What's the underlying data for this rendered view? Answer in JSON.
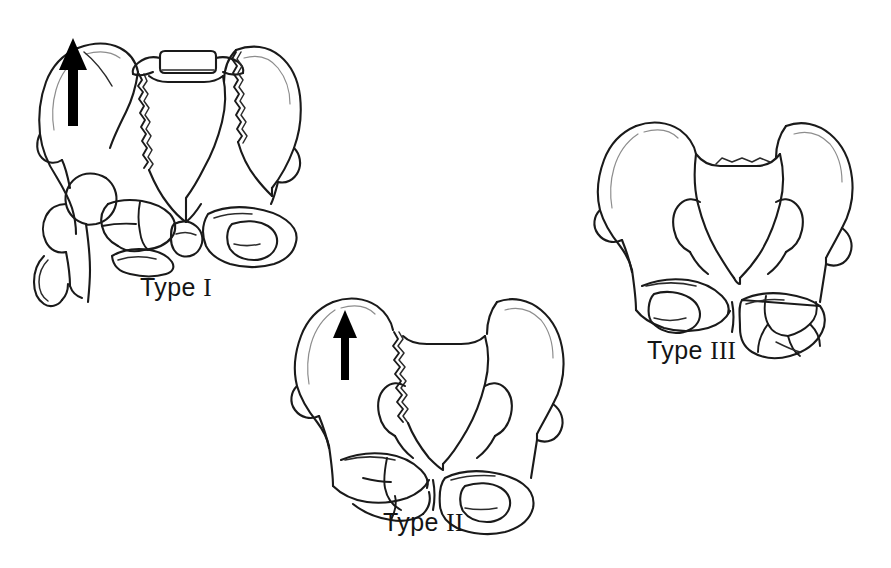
{
  "figure": {
    "kind": "medical-line-illustration",
    "background_color": "#ffffff",
    "ink_color": "#1a1a1a",
    "width": 891,
    "height": 568
  },
  "panels": [
    {
      "id": "type-1",
      "word": "Type",
      "numeral": "I",
      "label": "Type I",
      "label_x": 140,
      "label_y": 262,
      "art_x": 8,
      "art_y": 18,
      "art_w": 330,
      "art_h": 290,
      "has_arrow": true,
      "arrow_direction": "up",
      "arrow_meaning": "vertical displacement of hemipelvis",
      "features": [
        "left hemipelvis displaced superiorly",
        "left sacroiliac fracture-dislocation",
        "fragmented left pubic rami",
        "proximal femur visible at lower left",
        "L5 vertebral body with transverse processes at superior midline",
        "intact right obturator foramen"
      ]
    },
    {
      "id": "type-2",
      "word": "Type",
      "numeral": "II",
      "label": "Type II",
      "label_x": 383,
      "label_y": 510,
      "art_x": 275,
      "art_y": 282,
      "art_w": 320,
      "art_h": 228,
      "has_arrow": true,
      "arrow_direction": "up",
      "arrow_meaning": "vertical displacement of hemipelvis",
      "features": [
        "zigzag vertical fracture through left sacral ala",
        "upward displacement of left hemipelvis",
        "comminuted left inferior pubic ramus",
        "intact right obturator foramen"
      ]
    },
    {
      "id": "type-3",
      "word": "Type",
      "numeral": "III",
      "label": "Type III",
      "label_x": 647,
      "label_y": 338,
      "art_x": 580,
      "art_y": 104,
      "art_w": 302,
      "art_h": 228,
      "has_arrow": false,
      "arrow_direction": null,
      "arrow_meaning": null,
      "features": [
        "no displacement arrow shown",
        "comminuted fracture fragments of right pubic and ischial rami",
        "intact left obturator foramen",
        "symmetric iliac wings"
      ]
    }
  ],
  "arrows": [
    {
      "panel": "type-1",
      "x": 68,
      "y": 55,
      "length": 66,
      "direction": "up"
    },
    {
      "panel": "type-2",
      "x": 345,
      "y": 320,
      "length": 58,
      "direction": "up"
    }
  ]
}
